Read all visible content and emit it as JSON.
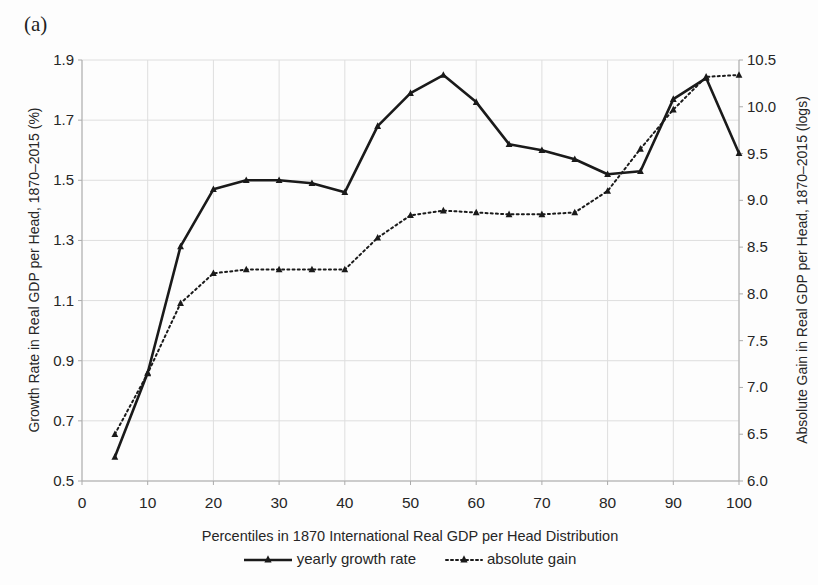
{
  "figure": {
    "panel_label": "(a)",
    "background": "#fdfdfd",
    "line_color": "#1a1a1a",
    "grid_color": "#dedede",
    "axis_color": "#ababab",
    "text_color": "#262626"
  },
  "chart_data": {
    "type": "line",
    "title": "",
    "xlabel": "Percentiles in 1870 International Real GDP per Head Distribution",
    "xlim": [
      0,
      100
    ],
    "x_ticks": [
      0,
      10,
      20,
      30,
      40,
      50,
      60,
      70,
      80,
      90,
      100
    ],
    "x": [
      5,
      10,
      15,
      20,
      25,
      30,
      35,
      40,
      45,
      50,
      55,
      60,
      65,
      70,
      75,
      80,
      85,
      90,
      95,
      100
    ],
    "left_axis": {
      "label": "Growth Rate in Real GDP per Head, 1870–2015 (%)",
      "lim": [
        0.5,
        1.9
      ],
      "ticks": [
        0.5,
        0.7,
        0.9,
        1.1,
        1.3,
        1.5,
        1.7,
        1.9
      ]
    },
    "right_axis": {
      "label": "Absolute Gain in Real GDP per Head, 1870–2015 (logs)",
      "lim": [
        6.0,
        10.5
      ],
      "ticks": [
        6.0,
        6.5,
        7.0,
        7.5,
        8.0,
        8.5,
        9.0,
        9.5,
        10.0,
        10.5
      ]
    },
    "grid": true,
    "legend_position": "bottom",
    "series": [
      {
        "name": "yearly growth rate",
        "axis": "left",
        "style": "solid",
        "marker": "filled-triangle",
        "values": [
          0.58,
          0.86,
          1.28,
          1.47,
          1.5,
          1.5,
          1.49,
          1.46,
          1.68,
          1.79,
          1.85,
          1.76,
          1.62,
          1.6,
          1.57,
          1.52,
          1.53,
          1.77,
          1.84,
          1.59
        ]
      },
      {
        "name": "absolute gain",
        "axis": "right",
        "style": "dotted",
        "marker": "filled-triangle",
        "values": [
          6.5,
          7.15,
          7.9,
          8.22,
          8.26,
          8.26,
          8.26,
          8.26,
          8.6,
          8.84,
          8.89,
          8.87,
          8.85,
          8.85,
          8.87,
          9.1,
          9.55,
          9.97,
          10.32,
          10.34
        ]
      }
    ]
  }
}
